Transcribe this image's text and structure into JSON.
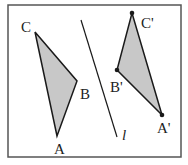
{
  "diagram": {
    "colors": {
      "frame": "#555555",
      "stroke": "#1a1a1a",
      "fill": "#c8c8c8",
      "text": "#222222"
    },
    "frame": {
      "x": 8,
      "y": 5,
      "width": 173,
      "height": 152
    },
    "line_l": {
      "label": "l",
      "x1": 81,
      "y1": 20,
      "x2": 117,
      "y2": 137
    },
    "triangle_original": {
      "vertices": [
        {
          "name": "A",
          "label": "A",
          "x": 57,
          "y": 136
        },
        {
          "name": "B",
          "label": "B",
          "x": 77,
          "y": 81
        },
        {
          "name": "C",
          "label": "C",
          "x": 35,
          "y": 32
        }
      ]
    },
    "triangle_image": {
      "vertices": [
        {
          "name": "A'",
          "label": "A'",
          "x": 162,
          "y": 115
        },
        {
          "name": "B'",
          "label": "B'",
          "x": 117,
          "y": 70
        },
        {
          "name": "C'",
          "label": "C'",
          "x": 132,
          "y": 13
        }
      ]
    },
    "labels": {
      "A": "A",
      "B": "B",
      "C": "C",
      "A_prime": "A'",
      "B_prime": "B'",
      "C_prime": "C'",
      "l": "l"
    }
  }
}
